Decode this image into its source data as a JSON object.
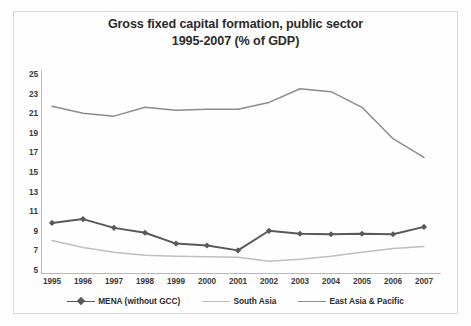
{
  "title": {
    "line1": "Gross fixed capital formation, public sector",
    "line2": "1995-2007 (% of GDP)"
  },
  "colors": {
    "mena": "#595959",
    "south_asia": "#bfbfbf",
    "east_asia": "#8c8c8c",
    "axis": "#b9b9b9",
    "text": "#3a3a3a",
    "background": "#fefefe",
    "frame": "#d8d8d8"
  },
  "chart_data": {
    "type": "line",
    "title": "Gross fixed capital formation, public sector 1995-2007 (% of GDP)",
    "xlabel": "",
    "ylabel": "",
    "categories": [
      "1995",
      "1996",
      "1997",
      "1998",
      "1999",
      "2000",
      "2001",
      "2002",
      "2003",
      "2004",
      "2005",
      "2006",
      "2007"
    ],
    "x": [
      1995,
      1996,
      1997,
      1998,
      1999,
      2000,
      2001,
      2002,
      2003,
      2004,
      2005,
      2006,
      2007
    ],
    "ylim": [
      5,
      25
    ],
    "yticks": [
      5,
      7,
      9,
      11,
      13,
      15,
      17,
      19,
      21,
      23,
      25
    ],
    "ytick_labels": [
      "5",
      "7",
      "9",
      "11",
      "13",
      "15",
      "17",
      "19",
      "21",
      "23",
      "25"
    ],
    "grid": false,
    "legend_position": "bottom",
    "series": [
      {
        "name": "MENA (without GCC)",
        "color": "#595959",
        "marker": "diamond",
        "values": [
          9.8,
          10.2,
          9.3,
          8.8,
          7.7,
          7.5,
          7.0,
          9.0,
          8.7,
          8.65,
          8.7,
          8.65,
          9.4
        ]
      },
      {
        "name": "South Asia",
        "color": "#bfbfbf",
        "marker": "none",
        "values": [
          8.0,
          7.3,
          6.8,
          6.5,
          6.4,
          6.35,
          6.3,
          5.9,
          6.1,
          6.4,
          6.8,
          7.2,
          7.4
        ]
      },
      {
        "name": "East Asia & Pacific",
        "color": "#8c8c8c",
        "marker": "none",
        "values": [
          21.7,
          21.0,
          20.7,
          21.6,
          21.3,
          21.4,
          21.4,
          22.1,
          23.5,
          23.2,
          21.6,
          18.4,
          16.5
        ]
      }
    ]
  },
  "legend": {
    "items": [
      {
        "label": "MENA (without GCC)"
      },
      {
        "label": "South Asia"
      },
      {
        "label": "East Asia & Pacific"
      }
    ]
  }
}
